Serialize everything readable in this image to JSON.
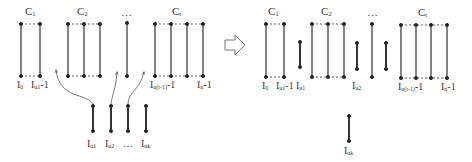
{
  "left": {
    "clusters": [
      {
        "label": "C",
        "sub": "1"
      },
      {
        "label": "C",
        "sub": "2"
      },
      {
        "label": "…",
        "sub": ""
      },
      {
        "label": "C",
        "sub": "t"
      }
    ],
    "bottom_labels": [
      {
        "text": "I",
        "sub": "0"
      },
      {
        "text": "I",
        "sub": "u1",
        "suffix": "-1"
      },
      {
        "text": "I",
        "sub": "uk",
        "suffix": ""
      },
      {
        "text": "I",
        "sub": "u(t-1)",
        "suffix": "-1"
      },
      {
        "text": "I",
        "sub": "n",
        "suffix": "-1"
      }
    ],
    "free_labels": [
      {
        "text": "I",
        "sub": "u1"
      },
      {
        "text": "I",
        "sub": "u2"
      },
      {
        "text": "…",
        "sub": ""
      },
      {
        "text": "I",
        "sub": "uk"
      }
    ]
  },
  "arrow": {
    "name": "transform-arrow"
  },
  "right": {
    "clusters": [
      {
        "label": "C",
        "sub": "1"
      },
      {
        "label": "C",
        "sub": "2"
      },
      {
        "label": "…",
        "sub": ""
      },
      {
        "label": "C",
        "sub": "t"
      }
    ],
    "bottom_labels": [
      {
        "text": "I",
        "sub": "0",
        "suffix": ""
      },
      {
        "text": "I",
        "sub": "u1",
        "suffix": "-1"
      },
      {
        "text": "I",
        "sub": "u1",
        "suffix": ""
      },
      {
        "text": "I",
        "sub": "u2",
        "suffix": ""
      },
      {
        "text": "I",
        "sub": "u(t-1)",
        "suffix": "-1"
      },
      {
        "text": "I",
        "sub": "n",
        "suffix": "-1"
      }
    ],
    "detached_label": {
      "text": "I",
      "sub": "uk"
    }
  }
}
